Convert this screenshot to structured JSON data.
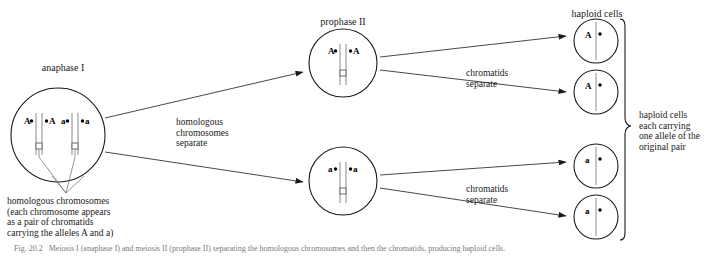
{
  "figure": {
    "title_visible": false,
    "background": "#ffffff",
    "stroke": "#1a1a1a"
  },
  "stages": {
    "anaphase": {
      "title": "anaphase I",
      "alleles": [
        "A",
        "A",
        "a",
        "a"
      ],
      "cell": {
        "cx": 58,
        "cy": 135,
        "r": 47
      }
    },
    "prophase_top": {
      "title": "prophase II",
      "alleles": [
        "A",
        "A"
      ],
      "cell": {
        "cx": 343,
        "cy": 63,
        "r": 34
      }
    },
    "prophase_bottom": {
      "title": "",
      "alleles": [
        "a",
        "a"
      ],
      "cell": {
        "cx": 343,
        "cy": 181,
        "r": 34
      }
    }
  },
  "haploid": {
    "heading": "haploid cells",
    "cells": [
      {
        "allele": "A",
        "cx": 596,
        "cy": 41,
        "r": 22
      },
      {
        "allele": "A",
        "cx": 596,
        "cy": 92,
        "r": 22
      },
      {
        "allele": "a",
        "cx": 596,
        "cy": 166,
        "r": 22
      },
      {
        "allele": "a",
        "cx": 596,
        "cy": 217,
        "r": 22
      }
    ]
  },
  "annotations": {
    "homologous_separate": "homologous\nchromosomes\nseparate",
    "chromatids_separate_top": "chromatids\nseparate",
    "chromatids_separate_bottom": "chromatids\nseparate",
    "left_caption": "homologous chromosomes\n(each chromosome appears\nas a pair of chromatids\ncarrying the alleles A and a)",
    "left_caption_lines": [
      "homologous chromosomes",
      "(each chromosome appears",
      "as a pair of chromatids",
      "carrying the alleles A and a)"
    ],
    "right_caption": "haploid cells\neach carrying\none allele of the\noriginal pair",
    "right_caption_lines": [
      "haploid cells",
      "each carrying",
      "one allele of the",
      "original pair"
    ]
  },
  "figure_caption": {
    "text": "Fig. 20.2   Meiosis I (anaphase I) and meiosis II (prophase II) separating the homologous chromosomes and then the chromatids, producing haploid cells."
  },
  "colors": {
    "outline": "#1a1a1a",
    "chromatid": "#888888",
    "text": "#1a1a1a",
    "caption": "#7a7a7a"
  }
}
